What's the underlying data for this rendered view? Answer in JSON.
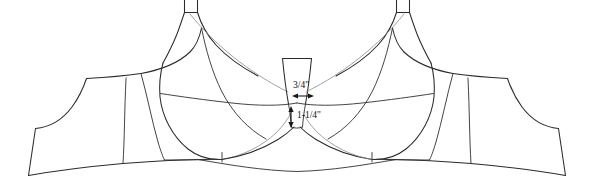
{
  "diagram": {
    "view": "front",
    "symmetry": "mirror-vertical",
    "background_color": "#ffffff",
    "outline_color": "#2b2b2b",
    "seam_color": "#3a3a3a",
    "guide_color": "#8a8a8a",
    "annotation_color": "#101010"
  },
  "annotations": [
    {
      "id": "gore-width",
      "label": "3/4\"",
      "orientation": "horizontal",
      "arrow": "double-headed",
      "x": 303,
      "y": 86,
      "arrow_x1": 293,
      "arrow_x2": 313,
      "arrow_y": 96
    },
    {
      "id": "gore-height",
      "label": "1-1/4\"",
      "orientation": "vertical",
      "arrow": "double-headed",
      "x": 299,
      "y": 116,
      "arrow_y1": 106,
      "arrow_y2": 128,
      "arrow_x": 291
    }
  ],
  "parts": {
    "left_cup": "left-cup-panel",
    "right_cup": "right-cup-panel",
    "left_side_panel": "left-side-band-panel",
    "right_side_panel": "right-side-band-panel",
    "center_gore": "center-front-gore",
    "left_strap": "left-strap-tab",
    "right_strap": "right-strap-tab",
    "band": "underband"
  }
}
